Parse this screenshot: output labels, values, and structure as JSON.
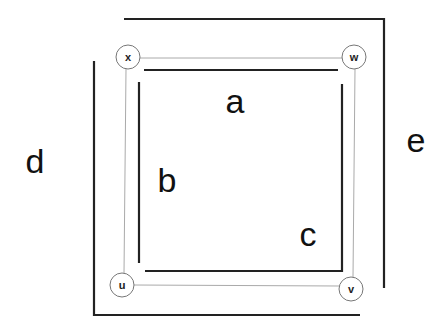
{
  "diagram": {
    "type": "graph-with-paths",
    "nodes": [
      {
        "id": "x",
        "label": "x",
        "cx": 128,
        "cy": 57
      },
      {
        "id": "w",
        "label": "w",
        "cx": 354,
        "cy": 57
      },
      {
        "id": "u",
        "label": "u",
        "cx": 122,
        "cy": 285
      },
      {
        "id": "v",
        "label": "v",
        "cx": 351,
        "cy": 289
      }
    ],
    "edges": [
      {
        "from": "x",
        "to": "w"
      },
      {
        "from": "x",
        "to": "u"
      },
      {
        "from": "w",
        "to": "v"
      },
      {
        "from": "u",
        "to": "v"
      }
    ],
    "paths": [
      {
        "id": "a",
        "label": "a"
      },
      {
        "id": "b",
        "label": "b"
      },
      {
        "id": "c",
        "label": "c"
      },
      {
        "id": "d",
        "label": "d"
      },
      {
        "id": "e",
        "label": "e"
      }
    ],
    "colors": {
      "edge": "#aaaaaa",
      "path": "#222222",
      "node_stroke": "#777777",
      "background": "#ffffff"
    }
  }
}
